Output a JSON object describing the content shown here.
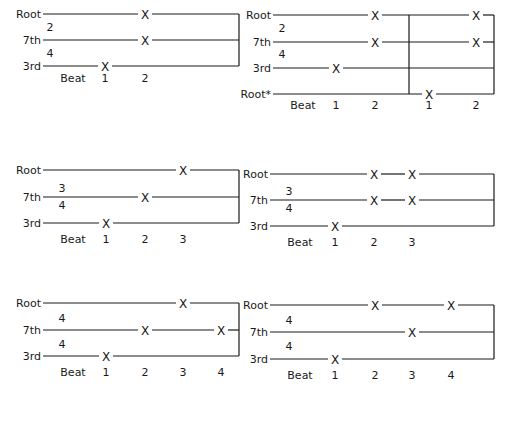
{
  "figure": {
    "title": "",
    "colors": {
      "ink": "#1a1a1a",
      "background": "#ffffff"
    },
    "beat_label": "Beat",
    "marker": "X",
    "diagrams": [
      {
        "id": "two-four",
        "time_signature": {
          "top": "2",
          "bottom": "4",
          "position": "above-lines"
        },
        "x_start": 43,
        "x_end": 239,
        "voices": [
          {
            "label": "Root",
            "y": 14,
            "marks_at_beats": [
              2
            ]
          },
          {
            "label": "7th",
            "y": 40,
            "marks_at_beats": [
              2
            ]
          },
          {
            "label": "3rd",
            "y": 66,
            "marks_at_beats": [
              1
            ]
          }
        ],
        "beats": [
          {
            "label": "1",
            "x": 105
          },
          {
            "label": "2",
            "x": 145
          }
        ],
        "beat_row_y": 82,
        "ts_x": 50,
        "ts_top_y": 31,
        "ts_bottom_y": 57,
        "divider_x": null
      },
      {
        "id": "two-four-two-bars",
        "time_signature": {
          "top": "2",
          "bottom": "4",
          "position": "above-lines"
        },
        "x_start": 273,
        "x_end": 494,
        "voices": [
          {
            "label": "Root",
            "y": 15,
            "marks_at_beats": [
              2,
              4
            ]
          },
          {
            "label": "7th",
            "y": 42,
            "marks_at_beats": [
              2,
              4
            ]
          },
          {
            "label": "3rd",
            "y": 68,
            "marks_at_beats": [
              1
            ]
          },
          {
            "label": "Root*",
            "y": 94,
            "marks_at_beats": [
              3
            ]
          }
        ],
        "beats": [
          {
            "label": "1",
            "x": 336
          },
          {
            "label": "2",
            "x": 375
          },
          {
            "label": "1",
            "x": 429
          },
          {
            "label": "2",
            "x": 476
          }
        ],
        "beat_row_y": 109,
        "ts_x": 282,
        "ts_top_y": 32,
        "ts_bottom_y": 58,
        "divider_x": 409
      },
      {
        "id": "three-four",
        "time_signature": {
          "top": "3",
          "bottom": "4",
          "position": "around-7th"
        },
        "x_start": 43,
        "x_end": 239,
        "voices": [
          {
            "label": "Root",
            "y": 170,
            "marks_at_beats": [
              3
            ]
          },
          {
            "label": "7th",
            "y": 197,
            "marks_at_beats": [
              2
            ]
          },
          {
            "label": "3rd",
            "y": 223,
            "marks_at_beats": [
              1
            ]
          }
        ],
        "beats": [
          {
            "label": "1",
            "x": 106
          },
          {
            "label": "2",
            "x": 145
          },
          {
            "label": "3",
            "x": 183
          }
        ],
        "beat_row_y": 243,
        "ts_x": 62,
        "ts_top_y": 192,
        "ts_bottom_y": 209,
        "divider_x": null
      },
      {
        "id": "three-four-b",
        "time_signature": {
          "top": "3",
          "bottom": "4",
          "position": "around-7th"
        },
        "x_start": 270,
        "x_end": 494,
        "voices": [
          {
            "label": "Root",
            "y": 174,
            "marks_at_beats": [
              2,
              3
            ]
          },
          {
            "label": "7th",
            "y": 200,
            "marks_at_beats": [
              2,
              3
            ]
          },
          {
            "label": "3rd",
            "y": 226,
            "marks_at_beats": [
              1
            ]
          }
        ],
        "beats": [
          {
            "label": "1",
            "x": 335
          },
          {
            "label": "2",
            "x": 374
          },
          {
            "label": "3",
            "x": 412
          }
        ],
        "beat_row_y": 246,
        "ts_x": 289,
        "ts_top_y": 195,
        "ts_bottom_y": 212,
        "divider_x": null
      },
      {
        "id": "four-four",
        "time_signature": {
          "top": "4",
          "bottom": "4",
          "position": "between-lines"
        },
        "x_start": 43,
        "x_end": 239,
        "voices": [
          {
            "label": "Root",
            "y": 303,
            "marks_at_beats": [
              3
            ]
          },
          {
            "label": "7th",
            "y": 330,
            "marks_at_beats": [
              2,
              4
            ]
          },
          {
            "label": "3rd",
            "y": 356,
            "marks_at_beats": [
              1
            ]
          }
        ],
        "beats": [
          {
            "label": "1",
            "x": 106
          },
          {
            "label": "2",
            "x": 145
          },
          {
            "label": "3",
            "x": 183
          },
          {
            "label": "4",
            "x": 221
          }
        ],
        "beat_row_y": 376,
        "ts_x": 62,
        "ts_top_y": 322,
        "ts_bottom_y": 348,
        "divider_x": null
      },
      {
        "id": "four-four-b",
        "time_signature": {
          "top": "4",
          "bottom": "4",
          "position": "between-lines"
        },
        "x_start": 270,
        "x_end": 494,
        "voices": [
          {
            "label": "Root",
            "y": 305,
            "marks_at_beats": [
              2,
              4
            ]
          },
          {
            "label": "7th",
            "y": 332,
            "marks_at_beats": [
              3
            ]
          },
          {
            "label": "3rd",
            "y": 359,
            "marks_at_beats": [
              1
            ]
          }
        ],
        "beats": [
          {
            "label": "1",
            "x": 335
          },
          {
            "label": "2",
            "x": 375
          },
          {
            "label": "3",
            "x": 412
          },
          {
            "label": "4",
            "x": 451
          }
        ],
        "beat_row_y": 379,
        "ts_x": 289,
        "ts_top_y": 324,
        "ts_bottom_y": 350,
        "divider_x": null
      }
    ]
  }
}
